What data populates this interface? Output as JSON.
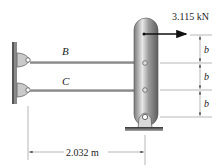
{
  "diagram": {
    "force": {
      "label": "3.115 kN",
      "color": "#111111"
    },
    "members": [
      {
        "name": "B",
        "label": "B"
      },
      {
        "name": "C",
        "label": "C"
      }
    ],
    "dimensions": {
      "horizontal": "2.032 m",
      "vertical": [
        "b",
        "b",
        "b"
      ]
    },
    "colors": {
      "rod": "#9a9a9a",
      "post_dark": "#6e6e6e",
      "post_light": "#e6e6e6",
      "wall": "#888888",
      "dim_line": "#777777"
    }
  }
}
